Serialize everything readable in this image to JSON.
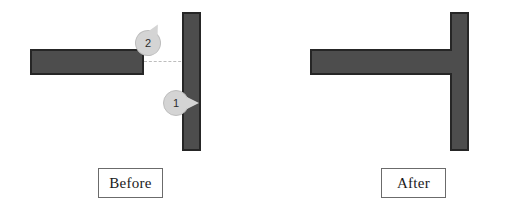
{
  "diagram": {
    "colors": {
      "bar_fill": "#4d4d4d",
      "bar_outline": "#262626",
      "callout_fill": "#d4d4d4",
      "callout_outline": "#bdbdbd",
      "dashed_line": "#bdbdbd",
      "caption_border": "#6b6b6b",
      "background": "#ffffff"
    }
  },
  "panels": [
    {
      "id": "before",
      "caption": "Before",
      "shapes": [
        {
          "name": "horizontal-bar",
          "orientation": "horizontal"
        },
        {
          "name": "vertical-bar",
          "orientation": "vertical"
        },
        {
          "name": "alignment-dashed-line",
          "style": "dashed"
        }
      ],
      "callouts": [
        {
          "number": "2",
          "points_to": "horizontal-bar-right-end"
        },
        {
          "number": "1",
          "points_to": "vertical-bar-left-face"
        }
      ]
    },
    {
      "id": "after",
      "caption": "After",
      "shapes": [
        {
          "name": "horizontal-bar",
          "orientation": "horizontal"
        },
        {
          "name": "vertical-bar",
          "orientation": "vertical"
        }
      ],
      "callouts": []
    }
  ],
  "callout_labels": {
    "one": "1",
    "two": "2"
  },
  "captions": {
    "before": "Before",
    "after": "After"
  }
}
